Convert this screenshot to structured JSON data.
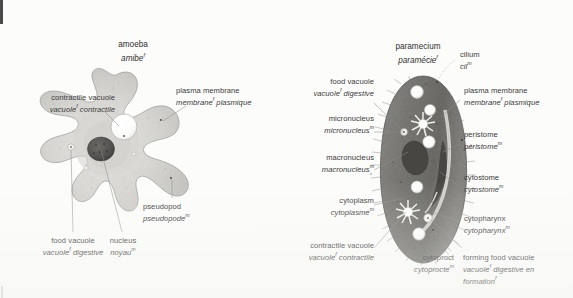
{
  "page": {
    "kind": "bilingual-biology-plate",
    "background_color": "#fcfcfb",
    "text_color": "#3a3a3a"
  },
  "figures": [
    {
      "id": "amoeba",
      "title": {
        "en": "amoeba",
        "fr": "amibe",
        "fr_gender": "f"
      },
      "labels": [
        {
          "id": "contractile-vacuole",
          "en": "contractile vacuole",
          "fr": "vacuole",
          "fr_rest": " contractile",
          "fr_gender": "f"
        },
        {
          "id": "plasma-membrane",
          "en": "plasma membrane",
          "fr": "membrane",
          "fr_rest": " plasmique",
          "fr_gender": "f"
        },
        {
          "id": "pseudopod",
          "en": "pseudopod",
          "fr": "pseudopode",
          "fr_rest": "",
          "fr_gender": "m"
        },
        {
          "id": "food-vacuole",
          "en": "food vacuole",
          "fr": "vacuole",
          "fr_rest": " digestive",
          "fr_gender": "f"
        },
        {
          "id": "nucleus",
          "en": "nucleus",
          "fr": "noyau",
          "fr_rest": "",
          "fr_gender": "m"
        }
      ]
    },
    {
      "id": "paramecium",
      "title": {
        "en": "paramecium",
        "fr": "paramécie",
        "fr_gender": "f"
      },
      "labels": [
        {
          "id": "cilium",
          "en": "cilium",
          "fr": "cil",
          "fr_rest": "",
          "fr_gender": "m"
        },
        {
          "id": "food-vacuole",
          "en": "food vacuole",
          "fr": "vacuole",
          "fr_rest": " digestive",
          "fr_gender": "f"
        },
        {
          "id": "plasma-membrane",
          "en": "plasma membrane",
          "fr": "membrane",
          "fr_rest": " plasmique",
          "fr_gender": "f"
        },
        {
          "id": "micronucleus",
          "en": "micronucleus",
          "fr": "micronucleus",
          "fr_rest": "",
          "fr_gender": "m"
        },
        {
          "id": "peristome",
          "en": "peristome",
          "fr": "péristome",
          "fr_rest": "",
          "fr_gender": "m"
        },
        {
          "id": "macronucleus",
          "en": "macronucleus",
          "fr": "macronucleus",
          "fr_rest": "",
          "fr_gender": "m"
        },
        {
          "id": "cytostome",
          "en": "cytostome",
          "fr": "cytostome",
          "fr_rest": "",
          "fr_gender": "m"
        },
        {
          "id": "cytoplasm",
          "en": "cytoplasm",
          "fr": "cytoplasme",
          "fr_rest": "",
          "fr_gender": "m"
        },
        {
          "id": "cytopharynx",
          "en": "cytopharynx",
          "fr": "cytopharynx",
          "fr_rest": "",
          "fr_gender": "m"
        },
        {
          "id": "contractile-vacuole",
          "en": "contractile vacuole",
          "fr": "vacuole",
          "fr_rest": " contractile",
          "fr_gender": "f"
        },
        {
          "id": "cytoproct",
          "en": "cytoproct",
          "fr": "cytoprocte",
          "fr_rest": "",
          "fr_gender": "m"
        },
        {
          "id": "forming-food-vacuole",
          "en": "forming food vacuole",
          "fr": "vacuole",
          "fr_rest": " digestive en formation",
          "fr_gender": "f",
          "fr_gender2": "f"
        }
      ]
    }
  ]
}
